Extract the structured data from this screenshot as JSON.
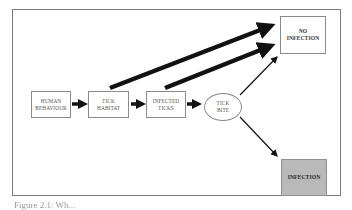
{
  "diagram": {
    "nodes": [
      {
        "id": "human_behaviour",
        "label": "HUMAN\nBEHAVIOUR",
        "shape": "rect"
      },
      {
        "id": "tick_habitat",
        "label": "TICK\nHABITAT",
        "shape": "rect"
      },
      {
        "id": "infected_ticks",
        "label": "INFECTED\nTICKS",
        "shape": "rect"
      },
      {
        "id": "tick_bite",
        "label": "TICK\nBITE",
        "shape": "ellipse"
      },
      {
        "id": "no_infection",
        "label": "NO\nINFECTION",
        "shape": "rect"
      },
      {
        "id": "infection",
        "label": "INFECTION",
        "shape": "rect",
        "fill": "#b9b9b9"
      }
    ],
    "edges": [
      {
        "from": "human_behaviour",
        "to": "tick_habitat",
        "weight": "medium"
      },
      {
        "from": "tick_habitat",
        "to": "infected_ticks",
        "weight": "medium"
      },
      {
        "from": "infected_ticks",
        "to": "tick_bite",
        "weight": "medium"
      },
      {
        "from": "tick_habitat",
        "to": "no_infection",
        "weight": "heavy"
      },
      {
        "from": "infected_ticks",
        "to": "no_infection",
        "weight": "heavy"
      },
      {
        "from": "tick_bite",
        "to": "no_infection",
        "weight": "thin"
      },
      {
        "from": "tick_bite",
        "to": "infection",
        "weight": "thin"
      }
    ],
    "colors": {
      "arrow": "#111111",
      "infection_fill": "#b9b9b9",
      "border": "#8a8a8a"
    }
  },
  "caption": {
    "text": "Figure 2.1: Wh..."
  }
}
